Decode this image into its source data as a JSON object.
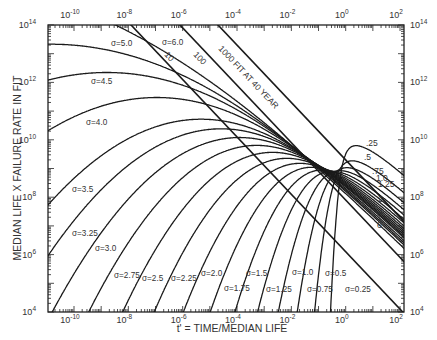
{
  "chart_data": {
    "type": "line",
    "title": "",
    "xlabel": "t' = TIME/MEDIAN LIFE",
    "ylabel": "MEDIAN LIFE X FAILURE RATE IN FIT",
    "x_scale": "log",
    "y_scale": "log",
    "xlim": [
      1e-11,
      120.0
    ],
    "ylim": [
      10000.0,
      100000000000000.0
    ],
    "x_tick_labels": [
      "10-10",
      "10-8",
      "10-6",
      "10-4",
      "10-2",
      "100",
      "102"
    ],
    "x_tick_exponents": [
      -10,
      -8,
      -6,
      -4,
      -2,
      0,
      2
    ],
    "y_tick_labels": [
      "104",
      "106",
      "108",
      "1010",
      "1012",
      "1014"
    ],
    "y_tick_exponents": [
      4,
      6,
      8,
      10,
      12,
      14
    ],
    "grid": false,
    "legend": "none (curves labeled inline)",
    "series": [
      {
        "name": "σ=6.0",
        "sigma": 6.0,
        "label": "σ=6.0"
      },
      {
        "name": "σ=5.0",
        "sigma": 5.0,
        "label": "σ=5.0"
      },
      {
        "name": "σ=4.5",
        "sigma": 4.5,
        "label": "σ=4.5"
      },
      {
        "name": "σ=4.0",
        "sigma": 4.0,
        "label": "σ=4.0"
      },
      {
        "name": "σ=3.5",
        "sigma": 3.5,
        "label": "σ=3.5"
      },
      {
        "name": "σ=3.25",
        "sigma": 3.25,
        "label": "σ=3.25"
      },
      {
        "name": "σ=3.0",
        "sigma": 3.0,
        "label": "σ=3.0"
      },
      {
        "name": "σ=2.75",
        "sigma": 2.75,
        "label": "σ=2.75"
      },
      {
        "name": "σ=2.5",
        "sigma": 2.5,
        "label": "σ=2.5"
      },
      {
        "name": "σ=2.25",
        "sigma": 2.25,
        "label": "σ=2.25"
      },
      {
        "name": "σ=2.0",
        "sigma": 2.0,
        "label": "σ=2.0"
      },
      {
        "name": "σ=1.75",
        "sigma": 1.75,
        "label": "σ=1.75"
      },
      {
        "name": "σ=1.5",
        "sigma": 1.5,
        "label": "σ=1.5"
      },
      {
        "name": "σ=1.25",
        "sigma": 1.25,
        "label": "σ=1.25"
      },
      {
        "name": "σ=1.0",
        "sigma": 1.0,
        "label": "σ=1.0"
      },
      {
        "name": "σ=0.75",
        "sigma": 0.75,
        "label": "σ=0.75"
      },
      {
        "name": "σ=0.5",
        "sigma": 0.5,
        "label": "σ=0.5"
      },
      {
        "name": "σ=0.25",
        "sigma": 0.25,
        "label": "σ=0.25"
      }
    ],
    "right_cluster_labels": [
      ".25",
      ".5",
      ".75",
      "1.0",
      "1.25",
      "2",
      "4",
      "6"
    ],
    "constant_fit_lines": [
      {
        "label": "10",
        "fit": 10
      },
      {
        "label": "100",
        "fit": 100
      },
      {
        "label": "1000  FIT AT 40 YEAR",
        "fit": 1000
      }
    ],
    "annotations": [
      "1000  FIT AT 40 YEAR"
    ]
  }
}
